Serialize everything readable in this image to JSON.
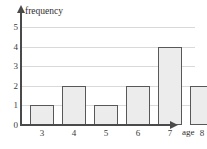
{
  "chart_data": {
    "type": "bar",
    "title": "",
    "xlabel": "age",
    "ylabel": "frequency",
    "categories": [
      "3",
      "4",
      "5",
      "6",
      "7",
      "8"
    ],
    "values": [
      1,
      2,
      1,
      2,
      4,
      2
    ],
    "ylim": [
      0,
      5
    ],
    "yticks": [
      "0",
      "1",
      "2",
      "3",
      "4",
      "5"
    ],
    "grid": true,
    "legend": "none",
    "colors": {
      "bar_fill": "#ececec",
      "bar_border": "#585858",
      "gridline": "#d9d9d9",
      "axis": "#4a4a4a",
      "text": "#2e2e2e",
      "background": "#ffffff"
    }
  }
}
